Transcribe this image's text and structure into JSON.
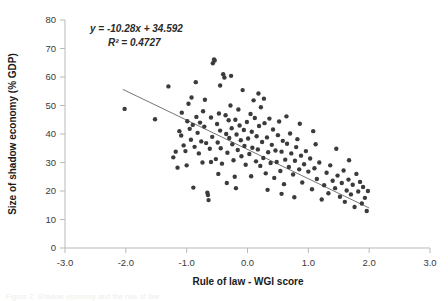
{
  "figure": {
    "caption_fragment": "Figure 2. Shadow economy and the rule of law"
  },
  "chart_data": {
    "type": "scatter",
    "title": "",
    "xlabel": "Rule of law - WGI score",
    "ylabel": "Size of shadow economy (% GDP)",
    "xlim": [
      -3.0,
      3.0
    ],
    "ylim": [
      0,
      80
    ],
    "xticks": [
      "-3.0",
      "-2.0",
      "-1.0",
      "0.0",
      "1.0",
      "2.0",
      "3.0"
    ],
    "xtick_values": [
      -3.0,
      -2.0,
      -1.0,
      0.0,
      1.0,
      2.0,
      3.0
    ],
    "yticks": [
      "0",
      "10",
      "20",
      "30",
      "40",
      "50",
      "60",
      "70",
      "80"
    ],
    "ytick_values": [
      0,
      10,
      20,
      30,
      40,
      50,
      60,
      70,
      80
    ],
    "grid": false,
    "legend": false,
    "point_color": "#3b3b3b",
    "point_size": 3.2,
    "annotations": [
      {
        "name": "regression-equation",
        "text": "y = -10.28x + 34.592"
      },
      {
        "name": "r-squared",
        "text": "R² = 0.4727"
      }
    ],
    "trendline": {
      "type": "linear",
      "slope": -10.28,
      "intercept": 34.592,
      "r_squared": 0.4727,
      "x_start": -2.05,
      "x_end": 2.0,
      "color": "#767676"
    },
    "series": [
      {
        "name": "Countries",
        "points": [
          [
            -2.02,
            48.8
          ],
          [
            -1.52,
            45.2
          ],
          [
            -1.3,
            56.7
          ],
          [
            -1.22,
            31.8
          ],
          [
            -1.18,
            33.8
          ],
          [
            -1.15,
            28.2
          ],
          [
            -1.12,
            41.0
          ],
          [
            -1.09,
            39.5
          ],
          [
            -1.05,
            36.0
          ],
          [
            -1.02,
            34.0
          ],
          [
            -1.0,
            29.0
          ],
          [
            -0.99,
            44.5
          ],
          [
            -0.97,
            50.6
          ],
          [
            -0.95,
            41.8
          ],
          [
            -0.93,
            38.0
          ],
          [
            -0.9,
            43.2
          ],
          [
            -0.89,
            21.2
          ],
          [
            -0.87,
            35.5
          ],
          [
            -0.85,
            58.2
          ],
          [
            -0.84,
            46.0
          ],
          [
            -0.82,
            40.4
          ],
          [
            -0.8,
            33.2
          ],
          [
            -0.78,
            44.0
          ],
          [
            -0.76,
            37.4
          ],
          [
            -0.74,
            30.0
          ],
          [
            -0.73,
            48.0
          ],
          [
            -0.71,
            42.6
          ],
          [
            -0.7,
            52.0
          ],
          [
            -0.68,
            36.8
          ],
          [
            -0.66,
            19.4
          ],
          [
            -0.65,
            18.6
          ],
          [
            -0.64,
            16.8
          ],
          [
            -0.62,
            34.8
          ],
          [
            -0.6,
            45.8
          ],
          [
            -0.58,
            39.0
          ],
          [
            -0.57,
            64.8
          ],
          [
            -0.55,
            66.2
          ],
          [
            -0.54,
            65.8
          ],
          [
            -0.52,
            31.2
          ],
          [
            -0.5,
            43.5
          ],
          [
            -0.49,
            37.0
          ],
          [
            -0.47,
            47.2
          ],
          [
            -0.45,
            41.2
          ],
          [
            -0.44,
            35.0
          ],
          [
            -0.42,
            29.6
          ],
          [
            -0.4,
            61.0
          ],
          [
            -0.38,
            59.8
          ],
          [
            -0.36,
            46.6
          ],
          [
            -0.35,
            40.0
          ],
          [
            -0.33,
            33.4
          ],
          [
            -0.31,
            44.8
          ],
          [
            -0.3,
            38.6
          ],
          [
            -0.28,
            50.0
          ],
          [
            -0.26,
            42.0
          ],
          [
            -0.25,
            36.4
          ],
          [
            -0.23,
            30.8
          ],
          [
            -0.21,
            25.0
          ],
          [
            -0.2,
            45.0
          ],
          [
            -0.18,
            39.8
          ],
          [
            -0.16,
            34.4
          ],
          [
            -0.15,
            48.6
          ],
          [
            -0.13,
            43.0
          ],
          [
            -0.11,
            37.8
          ],
          [
            -0.1,
            32.2
          ],
          [
            -0.08,
            55.4
          ],
          [
            -0.06,
            41.4
          ],
          [
            -0.05,
            35.8
          ],
          [
            -0.03,
            29.2
          ],
          [
            -0.01,
            44.2
          ],
          [
            0.01,
            38.4
          ],
          [
            0.03,
            33.0
          ],
          [
            0.05,
            47.0
          ],
          [
            0.07,
            40.8
          ],
          [
            0.08,
            35.2
          ],
          [
            0.1,
            51.8
          ],
          [
            0.12,
            45.6
          ],
          [
            0.14,
            30.4
          ],
          [
            0.15,
            39.2
          ],
          [
            0.17,
            34.6
          ],
          [
            0.19,
            42.8
          ],
          [
            0.21,
            28.8
          ],
          [
            0.22,
            49.4
          ],
          [
            0.24,
            37.2
          ],
          [
            0.26,
            31.6
          ],
          [
            0.28,
            43.8
          ],
          [
            0.3,
            26.2
          ],
          [
            0.32,
            38.8
          ],
          [
            0.34,
            33.6
          ],
          [
            0.36,
            45.4
          ],
          [
            0.38,
            29.8
          ],
          [
            0.4,
            36.2
          ],
          [
            0.42,
            41.6
          ],
          [
            0.44,
            24.6
          ],
          [
            0.46,
            34.2
          ],
          [
            0.48,
            30.2
          ],
          [
            0.5,
            39.6
          ],
          [
            0.52,
            44.4
          ],
          [
            0.54,
            27.0
          ],
          [
            0.56,
            33.8
          ],
          [
            0.58,
            37.6
          ],
          [
            0.6,
            22.4
          ],
          [
            0.62,
            31.0
          ],
          [
            0.65,
            36.6
          ],
          [
            0.68,
            28.4
          ],
          [
            0.7,
            40.2
          ],
          [
            0.72,
            33.2
          ],
          [
            0.75,
            25.8
          ],
          [
            0.78,
            30.6
          ],
          [
            0.8,
            35.4
          ],
          [
            0.82,
            38.2
          ],
          [
            0.85,
            27.6
          ],
          [
            0.88,
            32.4
          ],
          [
            0.9,
            23.0
          ],
          [
            0.93,
            29.4
          ],
          [
            0.96,
            34.0
          ],
          [
            1.0,
            26.8
          ],
          [
            1.03,
            31.4
          ],
          [
            1.06,
            20.6
          ],
          [
            1.1,
            28.0
          ],
          [
            1.14,
            24.2
          ],
          [
            1.18,
            30.0
          ],
          [
            1.22,
            17.0
          ],
          [
            1.26,
            22.0
          ],
          [
            1.3,
            26.4
          ],
          [
            1.33,
            19.2
          ],
          [
            1.36,
            29.0
          ],
          [
            1.4,
            23.6
          ],
          [
            1.44,
            21.0
          ],
          [
            1.48,
            25.4
          ],
          [
            1.52,
            18.0
          ],
          [
            1.55,
            22.8
          ],
          [
            1.58,
            27.2
          ],
          [
            1.6,
            16.2
          ],
          [
            1.63,
            20.2
          ],
          [
            1.66,
            24.0
          ],
          [
            1.7,
            18.8
          ],
          [
            1.73,
            22.2
          ],
          [
            1.76,
            14.4
          ],
          [
            1.79,
            26.0
          ],
          [
            1.82,
            19.8
          ],
          [
            1.85,
            23.2
          ],
          [
            1.88,
            15.6
          ],
          [
            1.9,
            21.4
          ],
          [
            1.93,
            17.6
          ],
          [
            1.96,
            13.0
          ],
          [
            1.98,
            20.0
          ],
          [
            -1.08,
            47.5
          ],
          [
            -0.92,
            52.8
          ],
          [
            -0.6,
            30.2
          ],
          [
            -0.48,
            26.0
          ],
          [
            -0.34,
            22.8
          ],
          [
            -0.19,
            21.0
          ],
          [
            0.06,
            25.2
          ],
          [
            0.33,
            20.4
          ],
          [
            0.56,
            19.0
          ],
          [
            0.77,
            17.8
          ],
          [
            1.12,
            36.4
          ],
          [
            1.46,
            34.8
          ],
          [
            1.67,
            30.8
          ],
          [
            -0.27,
            60.4
          ],
          [
            -0.45,
            57.0
          ],
          [
            0.18,
            54.2
          ],
          [
            0.27,
            52.4
          ],
          [
            0.64,
            46.2
          ],
          [
            0.86,
            43.6
          ],
          [
            1.08,
            41.0
          ]
        ]
      }
    ]
  }
}
